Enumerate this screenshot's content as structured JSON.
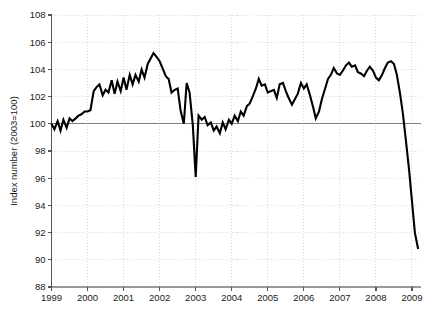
{
  "chart_data": {
    "type": "line",
    "title": "",
    "subtitle": "",
    "xlabel": "",
    "ylabel": "Index number (2003=100)",
    "xlim": [
      1999,
      2009.25
    ],
    "ylim": [
      88,
      108
    ],
    "grid": true,
    "legend": null,
    "reference_line": {
      "value": 100,
      "label": "",
      "color": "#808080"
    },
    "x_ticks": [
      "1999",
      "2000",
      "2001",
      "2002",
      "2003",
      "2004",
      "2005",
      "2006",
      "2007",
      "2008",
      "2009"
    ],
    "y_ticks": [
      "88",
      "90",
      "92",
      "94",
      "96",
      "98",
      "100",
      "102",
      "104",
      "106",
      "108"
    ],
    "series": [
      {
        "name": "Index",
        "color": "#000000",
        "x": [
          1999.0,
          1999.08,
          1999.17,
          1999.25,
          1999.33,
          1999.42,
          1999.5,
          1999.58,
          1999.67,
          1999.75,
          1999.83,
          1999.92,
          2000.0,
          2000.08,
          2000.17,
          2000.25,
          2000.33,
          2000.42,
          2000.5,
          2000.58,
          2000.67,
          2000.75,
          2000.83,
          2000.92,
          2001.0,
          2001.08,
          2001.17,
          2001.25,
          2001.33,
          2001.42,
          2001.5,
          2001.58,
          2001.67,
          2001.75,
          2001.83,
          2001.92,
          2002.0,
          2002.08,
          2002.17,
          2002.25,
          2002.33,
          2002.42,
          2002.5,
          2002.58,
          2002.67,
          2002.75,
          2002.83,
          2002.92,
          2003.0,
          2003.08,
          2003.17,
          2003.25,
          2003.33,
          2003.42,
          2003.5,
          2003.58,
          2003.67,
          2003.75,
          2003.83,
          2003.92,
          2004.0,
          2004.08,
          2004.17,
          2004.25,
          2004.33,
          2004.42,
          2004.5,
          2004.58,
          2004.67,
          2004.75,
          2004.83,
          2004.92,
          2005.0,
          2005.08,
          2005.17,
          2005.25,
          2005.33,
          2005.42,
          2005.5,
          2005.58,
          2005.67,
          2005.75,
          2005.83,
          2005.92,
          2006.0,
          2006.08,
          2006.17,
          2006.25,
          2006.33,
          2006.42,
          2006.5,
          2006.58,
          2006.67,
          2006.75,
          2006.83,
          2006.92,
          2007.0,
          2007.08,
          2007.17,
          2007.25,
          2007.33,
          2007.42,
          2007.5,
          2007.58,
          2007.67,
          2007.75,
          2007.83,
          2007.92,
          2008.0,
          2008.08,
          2008.17,
          2008.25,
          2008.33,
          2008.42,
          2008.5,
          2008.58,
          2008.67,
          2008.75,
          2008.83,
          2008.92,
          2009.0,
          2009.08,
          2009.17
        ],
        "values": [
          100.0,
          99.6,
          100.2,
          99.5,
          100.3,
          99.7,
          100.4,
          100.2,
          100.4,
          100.6,
          100.7,
          100.9,
          100.9,
          101.0,
          102.4,
          102.7,
          102.9,
          102.1,
          102.5,
          102.3,
          103.2,
          102.2,
          103.1,
          102.4,
          103.4,
          102.5,
          103.6,
          102.9,
          103.6,
          103.1,
          104.0,
          103.4,
          104.4,
          104.8,
          105.2,
          104.9,
          104.6,
          104.1,
          103.5,
          103.3,
          102.3,
          102.5,
          102.6,
          101.0,
          100.0,
          103.0,
          102.3,
          99.9,
          96.1,
          100.6,
          100.3,
          100.5,
          99.9,
          100.1,
          99.5,
          99.8,
          99.3,
          100.1,
          99.6,
          100.3,
          100.0,
          100.6,
          100.2,
          100.9,
          100.6,
          101.3,
          101.5,
          102.0,
          102.6,
          103.3,
          102.8,
          102.9,
          102.3,
          102.4,
          102.5,
          101.9,
          102.9,
          103.0,
          102.4,
          101.9,
          101.4,
          101.8,
          102.2,
          103.0,
          102.6,
          102.9,
          102.1,
          101.3,
          100.4,
          100.9,
          101.8,
          102.5,
          103.3,
          103.6,
          104.1,
          103.7,
          103.6,
          103.9,
          104.3,
          104.5,
          104.2,
          104.3,
          103.8,
          103.7,
          103.5,
          103.9,
          104.2,
          103.9,
          103.4,
          103.2,
          103.6,
          104.1,
          104.5,
          104.6,
          104.4,
          103.6,
          102.2,
          100.7,
          98.8,
          96.6,
          94.3,
          92.0,
          90.8
        ]
      }
    ]
  },
  "axes": {
    "y_axis_label": "Index number (2003=100)"
  }
}
